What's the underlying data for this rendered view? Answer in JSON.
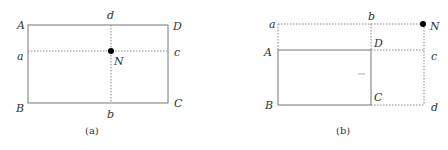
{
  "figure_a": {
    "caption": "(a)",
    "labels": {
      "A": "A",
      "B": "B",
      "C": "C",
      "D": "D",
      "a": "a",
      "b": "b",
      "c": "c",
      "d": "d",
      "N": "N"
    }
  },
  "figure_b": {
    "caption": "(b)",
    "labels": {
      "A": "A",
      "B": "B",
      "C": "C",
      "D": "D",
      "a": "a",
      "b": "b",
      "c": "c",
      "d": "d",
      "N": "N"
    }
  },
  "colors": {
    "line": "#666666",
    "dot": "#000000"
  }
}
